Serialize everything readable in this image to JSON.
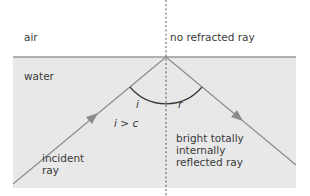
{
  "diagram": {
    "colors": {
      "background": "#ffffff",
      "water": "#e8e8e8",
      "interface": "#9a9a9a",
      "ray": "#8c8c8c",
      "arc": "#3a3a3a",
      "normal": "#555555",
      "text": "#3a3a3a"
    },
    "media": {
      "upper": "air",
      "lower": "water"
    },
    "labels": {
      "no_refracted": "no refracted ray",
      "angle_i": "i",
      "angle_r": "r",
      "condition": "i > c",
      "incident_line1": "incident",
      "incident_line2": "ray",
      "reflected_line1": "bright totally",
      "reflected_line2": "internally",
      "reflected_line3": "reflected ray"
    }
  }
}
